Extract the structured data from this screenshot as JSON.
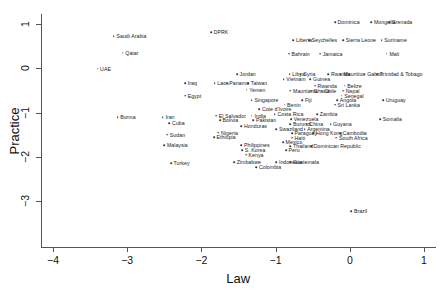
{
  "chart_data": {
    "type": "scatter",
    "title": "",
    "xlabel": "Law",
    "ylabel": "Practice",
    "xlim": [
      -4.35,
      1.15
    ],
    "ylim": [
      -3.55,
      1.35
    ],
    "xticks": [
      -4,
      -3,
      -2,
      -1,
      0,
      1
    ],
    "xticklabels": [
      "−4",
      "−3",
      "−2",
      "−1",
      "0",
      "1"
    ],
    "yticks": [
      1,
      0,
      -1,
      -2,
      -3
    ],
    "yticklabels": [
      "1",
      "0",
      "−1",
      "−2",
      "−3"
    ],
    "grid": false,
    "legend": null,
    "marker_color": "#3a3a3a",
    "axis_color": "#555555",
    "points": [
      {
        "label": "Saudi Arabia",
        "x": -3.18,
        "y": 0.73
      },
      {
        "label": "Qatar",
        "x": -3.06,
        "y": 0.35
      },
      {
        "label": "UAE",
        "x": -3.4,
        "y": -0.01
      },
      {
        "label": "Burma",
        "x": -3.13,
        "y": -1.11
      },
      {
        "label": "DPRK",
        "x": -1.87,
        "y": 0.81
      },
      {
        "label": "Dominica",
        "x": -0.2,
        "y": 1.04
      },
      {
        "label": "Mongolia",
        "x": 0.29,
        "y": 1.04
      },
      {
        "label": "Grenada",
        "x": 0.53,
        "y": 1.04
      },
      {
        "label": "Liberia",
        "x": -0.76,
        "y": 0.64
      },
      {
        "label": "Seychelles",
        "x": -0.55,
        "y": 0.64
      },
      {
        "label": "Sierra Leone",
        "x": -0.09,
        "y": 0.64
      },
      {
        "label": "Suriname",
        "x": 0.43,
        "y": 0.64
      },
      {
        "label": "Bahrain",
        "x": -0.82,
        "y": 0.33
      },
      {
        "label": "Jamaica",
        "x": -0.4,
        "y": 0.33
      },
      {
        "label": "Mali",
        "x": 0.5,
        "y": 0.33
      },
      {
        "label": "Jordan",
        "x": -1.52,
        "y": -0.13
      },
      {
        "label": "Libya",
        "x": -0.81,
        "y": -0.13
      },
      {
        "label": "Syria",
        "x": -0.66,
        "y": -0.13
      },
      {
        "label": "Rwanda",
        "x": -0.29,
        "y": -0.13
      },
      {
        "label": "Mauritius",
        "x": -0.12,
        "y": -0.13
      },
      {
        "label": "Gabon",
        "x": 0.2,
        "y": -0.13
      },
      {
        "label": "Trinidad & Tobago",
        "x": 0.37,
        "y": -0.13
      },
      {
        "label": "Vietnam",
        "x": -0.89,
        "y": -0.25
      },
      {
        "label": "Guinea",
        "x": -0.53,
        "y": -0.25
      },
      {
        "label": "Iraq",
        "x": -2.22,
        "y": -0.34
      },
      {
        "label": "Laos",
        "x": -1.82,
        "y": -0.34
      },
      {
        "label": "Panama",
        "x": -1.66,
        "y": -0.34
      },
      {
        "label": "Taiwan",
        "x": -1.37,
        "y": -0.34
      },
      {
        "label": "Rwanda2",
        "x": -0.47,
        "y": -0.39
      },
      {
        "label": "Belize",
        "x": -0.07,
        "y": -0.39
      },
      {
        "label": "Yemen",
        "x": -1.39,
        "y": -0.48
      },
      {
        "label": "Mauritania",
        "x": -0.8,
        "y": -0.51
      },
      {
        "label": "Ghana",
        "x": -0.52,
        "y": -0.51
      },
      {
        "label": "Chile",
        "x": -0.38,
        "y": -0.51
      },
      {
        "label": "Nepal",
        "x": -0.09,
        "y": -0.51
      },
      {
        "label": "Senegal",
        "x": -0.11,
        "y": -0.62
      },
      {
        "label": "Egypt",
        "x": -2.22,
        "y": -0.62
      },
      {
        "label": "Singapore",
        "x": -1.32,
        "y": -0.72
      },
      {
        "label": "Fiji",
        "x": -0.64,
        "y": -0.72
      },
      {
        "label": "Angola",
        "x": -0.17,
        "y": -0.72
      },
      {
        "label": "Uruguay",
        "x": 0.45,
        "y": -0.72
      },
      {
        "label": "Benin",
        "x": -0.88,
        "y": -0.82
      },
      {
        "label": "Sri Lanka",
        "x": -0.2,
        "y": -0.82
      },
      {
        "label": "Cote d'Ivoire",
        "x": -1.22,
        "y": -0.92
      },
      {
        "label": "Iran",
        "x": -2.52,
        "y": -1.11
      },
      {
        "label": "El Salvador",
        "x": -1.8,
        "y": -1.07
      },
      {
        "label": "India",
        "x": -1.32,
        "y": -1.07
      },
      {
        "label": "Costa Rica",
        "x": -1.01,
        "y": -1.03
      },
      {
        "label": "Zambia",
        "x": -0.44,
        "y": -1.03
      },
      {
        "label": "Bolivia",
        "x": -1.75,
        "y": -1.17
      },
      {
        "label": "Pakistan",
        "x": -1.3,
        "y": -1.17
      },
      {
        "label": "Venezuela",
        "x": -0.79,
        "y": -1.15
      },
      {
        "label": "Somalia",
        "x": 0.41,
        "y": -1.15
      },
      {
        "label": "Cuba",
        "x": -2.43,
        "y": -1.24
      },
      {
        "label": "Burundi",
        "x": -0.8,
        "y": -1.26
      },
      {
        "label": "China",
        "x": -0.58,
        "y": -1.26
      },
      {
        "label": "Guyana",
        "x": -0.26,
        "y": -1.26
      },
      {
        "label": "Honduras",
        "x": -1.46,
        "y": -1.31
      },
      {
        "label": "Swaziland",
        "x": -0.99,
        "y": -1.37
      },
      {
        "label": "Argentina",
        "x": -0.61,
        "y": -1.37
      },
      {
        "label": "Nigeria",
        "x": -1.77,
        "y": -1.45
      },
      {
        "label": "Sudan",
        "x": -2.46,
        "y": -1.5
      },
      {
        "label": "Paraguay",
        "x": -0.78,
        "y": -1.47
      },
      {
        "label": "Hong Kong",
        "x": -0.49,
        "y": -1.47
      },
      {
        "label": "Cambodia",
        "x": -0.13,
        "y": -1.47
      },
      {
        "label": "Ethiopia",
        "x": -1.83,
        "y": -1.56
      },
      {
        "label": "Haiti",
        "x": -0.78,
        "y": -1.57
      },
      {
        "label": "South Africa",
        "x": -0.18,
        "y": -1.57
      },
      {
        "label": "Mexico",
        "x": -0.9,
        "y": -1.67
      },
      {
        "label": "Malaysia",
        "x": -2.5,
        "y": -1.74
      },
      {
        "label": "Philippines",
        "x": -1.46,
        "y": -1.74
      },
      {
        "label": "Thailand",
        "x": -0.8,
        "y": -1.76
      },
      {
        "label": "Dominican Republic",
        "x": -0.52,
        "y": -1.76
      },
      {
        "label": "S. Korea",
        "x": -1.45,
        "y": -1.85
      },
      {
        "label": "Peru",
        "x": -0.86,
        "y": -1.85
      },
      {
        "label": "Kenya",
        "x": -1.4,
        "y": -1.95
      },
      {
        "label": "Turkey",
        "x": -2.41,
        "y": -2.14
      },
      {
        "label": "Zimbabwe",
        "x": -1.56,
        "y": -2.12
      },
      {
        "label": "Indonesia",
        "x": -0.99,
        "y": -2.12
      },
      {
        "label": "Guatemala",
        "x": -0.8,
        "y": -2.12
      },
      {
        "label": "Colombia",
        "x": -1.26,
        "y": -2.23
      },
      {
        "label": "Brazil",
        "x": 0.02,
        "y": -3.22
      }
    ]
  }
}
